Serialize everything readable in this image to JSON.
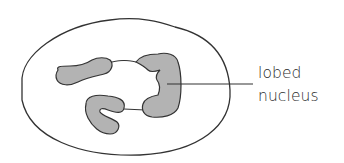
{
  "diagram": {
    "labels": [
      {
        "id": "nucleus-label",
        "lines": [
          "lobed",
          "nucleus"
        ],
        "target": "nucleus"
      }
    ],
    "colors": {
      "outline": "#333333",
      "nucleus_fill": "#b3b3b3",
      "background": "#ffffff",
      "text": "#2b2b2b"
    }
  }
}
